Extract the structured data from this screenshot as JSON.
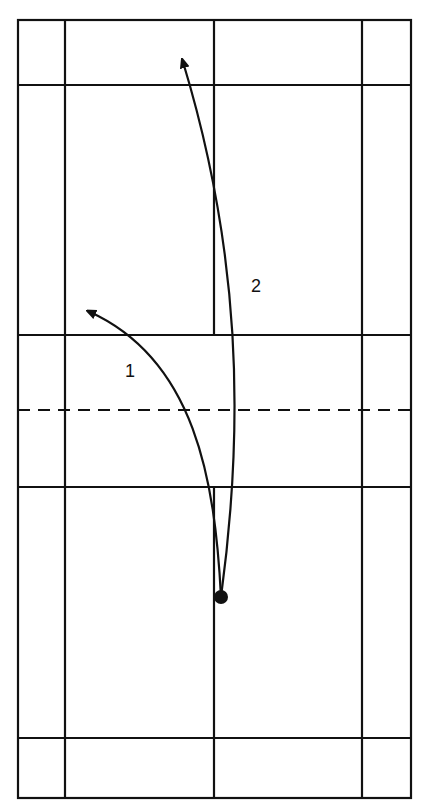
{
  "diagram": {
    "type": "badminton-court-shot-trajectories",
    "colors": {
      "line": "#111111",
      "background": "#ffffff"
    },
    "court": {
      "outer": {
        "x1": 18,
        "y1": 20,
        "x2": 411,
        "y2": 798
      },
      "singles_sidelines_x": [
        65,
        362
      ],
      "center_line_x": 214,
      "horizontal_lines_y": [
        85,
        335,
        487,
        738
      ],
      "net_y": 410,
      "net_style": "dashed"
    },
    "player": {
      "x": 221,
      "y": 597,
      "r": 7
    },
    "shots": [
      {
        "id": 1,
        "label": "1",
        "path": "M221,597 C215,480 195,360 90,312",
        "label_x": 125,
        "label_y": 377
      },
      {
        "id": 2,
        "label": "2",
        "path": "M221,597 C245,420 240,250 183,62",
        "label_x": 251,
        "label_y": 292
      }
    ]
  }
}
